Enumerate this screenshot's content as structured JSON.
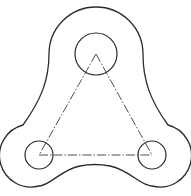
{
  "drawing": {
    "title": "Three-lobe plate",
    "type": "technical-drawing",
    "line_color": "#2b2b2b",
    "background": "#ffffff",
    "features": [
      {
        "name": "outer-profile",
        "kind": "closed-contour",
        "style": "solid"
      },
      {
        "name": "hole-top",
        "kind": "circle",
        "style": "solid"
      },
      {
        "name": "hole-bottom-left",
        "kind": "circle",
        "style": "solid"
      },
      {
        "name": "hole-bottom-right",
        "kind": "circle",
        "style": "solid"
      },
      {
        "name": "center-triangle",
        "kind": "triangle",
        "style": "dash-dot"
      }
    ]
  }
}
